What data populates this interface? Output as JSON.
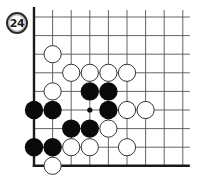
{
  "problem": {
    "number": "24"
  },
  "board": {
    "columns": 9,
    "rows": 9,
    "origin_x": 34,
    "origin_y": 17,
    "spacing": 18.6,
    "line_color": "#555555",
    "edge_color": "#1a1a1a",
    "edges": [
      "left",
      "bottom"
    ],
    "stone_radius": 8.6,
    "black_color": "#0a0a0a",
    "white_fill": "#ffffff",
    "white_stroke": "#333333",
    "star_points": [
      [
        3,
        5
      ]
    ],
    "white_stones": [
      [
        1,
        2
      ],
      [
        2,
        3
      ],
      [
        3,
        3
      ],
      [
        4,
        3
      ],
      [
        5,
        3
      ],
      [
        1,
        4
      ],
      [
        5,
        5
      ],
      [
        6,
        5
      ],
      [
        4,
        6
      ],
      [
        2,
        7
      ],
      [
        3,
        7
      ],
      [
        5,
        7
      ],
      [
        1,
        8
      ]
    ],
    "black_stones": [
      [
        3,
        4
      ],
      [
        4,
        4
      ],
      [
        0,
        5
      ],
      [
        1,
        5
      ],
      [
        4,
        5
      ],
      [
        2,
        6
      ],
      [
        3,
        6
      ],
      [
        0,
        7
      ],
      [
        1,
        7
      ]
    ]
  }
}
